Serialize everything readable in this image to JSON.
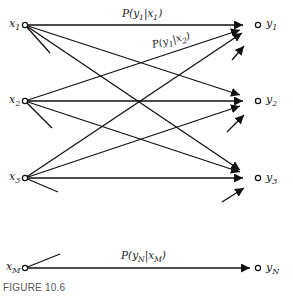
{
  "diagram": {
    "inputs": [
      {
        "id": "x1",
        "label": "x",
        "sub": "1"
      },
      {
        "id": "x2",
        "label": "x",
        "sub": "2"
      },
      {
        "id": "x3",
        "label": "x",
        "sub": "3"
      },
      {
        "id": "xM",
        "label": "x",
        "sub": "M"
      }
    ],
    "outputs": [
      {
        "id": "y1",
        "label": "y",
        "sub": "1"
      },
      {
        "id": "y2",
        "label": "y",
        "sub": "2"
      },
      {
        "id": "y3",
        "label": "y",
        "sub": "3"
      },
      {
        "id": "yN",
        "label": "y",
        "sub": "N"
      }
    ],
    "edge_labels": {
      "p_y1_x1": "P(y₁|x₁)",
      "p_y1_x2": "P(y₁|x₂)",
      "p_yN_xM": "P(yₙ|xₘ)"
    },
    "edge_label_parts": {
      "p_y1_x1": {
        "a": "P(y",
        "asub": "1",
        "b": "|x",
        "bsub": "1",
        "c": ")"
      },
      "p_y1_x2": {
        "a": "P(y",
        "asub": "1",
        "b": "|x",
        "bsub": "2",
        "c": ")"
      },
      "p_yN_xM": {
        "a": "P(y",
        "asub": "N",
        "b": "|x",
        "bsub": "M",
        "c": ")"
      }
    },
    "caption": "FIGURE 10.6"
  }
}
